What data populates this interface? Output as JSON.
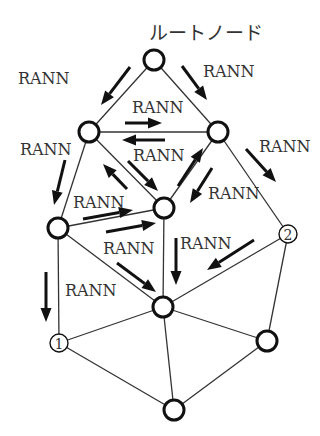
{
  "title": "ルートノード",
  "message_label": "RANN",
  "nodes": [
    {
      "id": "root",
      "x": 154,
      "y": 60,
      "label": ""
    },
    {
      "id": "upper-left",
      "x": 89,
      "y": 132,
      "label": ""
    },
    {
      "id": "upper-right",
      "x": 218,
      "y": 132,
      "label": ""
    },
    {
      "id": "center",
      "x": 164,
      "y": 208,
      "label": ""
    },
    {
      "id": "mid-left",
      "x": 58,
      "y": 228,
      "label": ""
    },
    {
      "id": "node-2",
      "x": 288,
      "y": 234,
      "label": "2"
    },
    {
      "id": "lower-center",
      "x": 163,
      "y": 307,
      "label": ""
    },
    {
      "id": "node-1",
      "x": 59,
      "y": 343,
      "label": "1"
    },
    {
      "id": "lower-right",
      "x": 267,
      "y": 341,
      "label": ""
    },
    {
      "id": "bottom",
      "x": 174,
      "y": 410,
      "label": ""
    }
  ],
  "edges": [
    [
      "root",
      "upper-left"
    ],
    [
      "root",
      "upper-right"
    ],
    [
      "upper-left",
      "upper-right"
    ],
    [
      "upper-left",
      "center"
    ],
    [
      "upper-right",
      "center"
    ],
    [
      "upper-left",
      "mid-left"
    ],
    [
      "upper-right",
      "node-2"
    ],
    [
      "mid-left",
      "center"
    ],
    [
      "mid-left",
      "lower-center"
    ],
    [
      "center",
      "lower-center"
    ],
    [
      "node-2",
      "lower-center"
    ],
    [
      "mid-left",
      "node-1"
    ],
    [
      "node-2",
      "lower-right"
    ],
    [
      "lower-center",
      "node-1"
    ],
    [
      "lower-center",
      "lower-right"
    ],
    [
      "lower-center",
      "bottom"
    ],
    [
      "node-1",
      "bottom"
    ],
    [
      "lower-right",
      "bottom"
    ]
  ],
  "labels": [
    {
      "text": "RANN",
      "x": 18,
      "y": 84
    },
    {
      "text": "RANN",
      "x": 203,
      "y": 77
    },
    {
      "text": "RANN",
      "x": 132,
      "y": 113
    },
    {
      "text": "RANN",
      "x": 20,
      "y": 155
    },
    {
      "text": "RANN",
      "x": 133,
      "y": 161
    },
    {
      "text": "RANN",
      "x": 259,
      "y": 152
    },
    {
      "text": "RANN",
      "x": 208,
      "y": 199
    },
    {
      "text": "RANN",
      "x": 73,
      "y": 208
    },
    {
      "text": "RANN",
      "x": 103,
      "y": 254
    },
    {
      "text": "RANN",
      "x": 180,
      "y": 249
    },
    {
      "text": "RANN",
      "x": 65,
      "y": 296
    }
  ],
  "arrows": [
    {
      "x1": 130,
      "y1": 67,
      "x2": 101,
      "y2": 105
    },
    {
      "x1": 182,
      "y1": 66,
      "x2": 207,
      "y2": 100
    },
    {
      "x1": 125,
      "y1": 123,
      "x2": 162,
      "y2": 123
    },
    {
      "x1": 165,
      "y1": 140,
      "x2": 122,
      "y2": 140
    },
    {
      "x1": 128,
      "y1": 161,
      "x2": 158,
      "y2": 191
    },
    {
      "x1": 127,
      "y1": 189,
      "x2": 103,
      "y2": 164
    },
    {
      "x1": 178,
      "y1": 186,
      "x2": 203,
      "y2": 148
    },
    {
      "x1": 212,
      "y1": 168,
      "x2": 190,
      "y2": 203
    },
    {
      "x1": 246,
      "y1": 149,
      "x2": 276,
      "y2": 182
    },
    {
      "x1": 65,
      "y1": 160,
      "x2": 54,
      "y2": 205
    },
    {
      "x1": 83,
      "y1": 219,
      "x2": 133,
      "y2": 210
    },
    {
      "x1": 106,
      "y1": 232,
      "x2": 156,
      "y2": 223
    },
    {
      "x1": 176,
      "y1": 238,
      "x2": 176,
      "y2": 285
    },
    {
      "x1": 254,
      "y1": 240,
      "x2": 207,
      "y2": 270
    },
    {
      "x1": 117,
      "y1": 263,
      "x2": 156,
      "y2": 292
    },
    {
      "x1": 46,
      "y1": 272,
      "x2": 46,
      "y2": 322
    }
  ]
}
